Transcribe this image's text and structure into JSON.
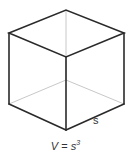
{
  "diagram": {
    "type": "cube",
    "side_label": "s",
    "formula": {
      "lhs": "V",
      "eq": " = ",
      "base": "s",
      "exponent": "3"
    },
    "colors": {
      "visible_edge": "#2a2a2a",
      "hidden_edge": "#c8c8c8",
      "background": "#ffffff"
    }
  }
}
